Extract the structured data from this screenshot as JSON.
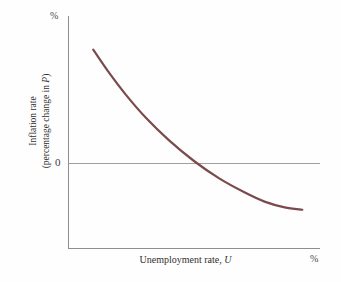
{
  "chart_data": {
    "type": "line",
    "title": "",
    "subtitle": "",
    "xlabel_text": "Unemployment rate, ",
    "xlabel_var": "U",
    "ylabel_line1": "Inflation rate",
    "ylabel_line2_pre": "(percentage change in ",
    "ylabel_line2_var": "P",
    "ylabel_line2_post": ")",
    "x_unit": "%",
    "y_unit": "%",
    "y_tick_labels": [
      "0"
    ],
    "x_tick_labels": [],
    "grid": false,
    "legend_position": "none",
    "annotations": [],
    "series": [
      {
        "name": "Phillips curve",
        "color": "#7a4a4c",
        "line_width": 2.2,
        "x": [
          0.1,
          0.16,
          0.23,
          0.31,
          0.4,
          0.5,
          0.6,
          0.7,
          0.78,
          0.86,
          0.93
        ],
        "y": [
          0.855,
          0.76,
          0.66,
          0.56,
          0.465,
          0.375,
          0.3,
          0.24,
          0.2,
          0.175,
          0.165
        ]
      }
    ],
    "axis_pixels": {
      "x0": 68,
      "x1": 320,
      "y_top": 16,
      "y_bottom": 248,
      "zero_y": 163
    },
    "colors": {
      "curve": "#7a4a4c",
      "axis": "#8e8e8e",
      "zero_line": "#a0a0a0",
      "background": "#fefefe",
      "text": "#2f2f2f"
    }
  }
}
